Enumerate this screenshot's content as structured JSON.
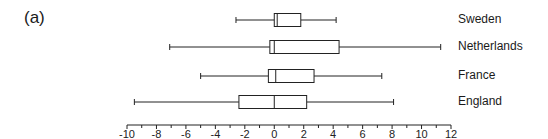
{
  "panel_label": "(a)",
  "chart_data": {
    "type": "boxplot",
    "orientation": "horizontal",
    "title": "",
    "xlabel": "",
    "ylabel": "",
    "xlim": [
      -10,
      12
    ],
    "x_ticks_major": [
      -10,
      -8,
      -6,
      -4,
      -2,
      0,
      2,
      4,
      6,
      8,
      10,
      12
    ],
    "x_ticks_minor": [
      -9,
      -7,
      -5,
      -3,
      -1,
      1,
      3,
      5,
      7,
      9,
      11
    ],
    "grid": false,
    "categories": [
      "Sweden",
      "Netherlands",
      "France",
      "England"
    ],
    "series": [
      {
        "name": "Sweden",
        "whisker_low": -2.6,
        "q1": 0.0,
        "median": 0.2,
        "q3": 1.8,
        "whisker_high": 4.2
      },
      {
        "name": "Netherlands",
        "whisker_low": -7.1,
        "q1": -0.3,
        "median": 0.0,
        "q3": 4.4,
        "whisker_high": 11.3
      },
      {
        "name": "France",
        "whisker_low": -5.0,
        "q1": -0.4,
        "median": 0.1,
        "q3": 2.7,
        "whisker_high": 7.3
      },
      {
        "name": "England",
        "whisker_low": -9.5,
        "q1": -2.4,
        "median": 0.0,
        "q3": 2.2,
        "whisker_high": 8.1
      }
    ]
  },
  "layout": {
    "x0_px": 127,
    "x1_px": 451,
    "axis_y_px": 125,
    "row_centers_px": [
      20,
      47,
      76,
      102
    ],
    "box_half_height_px": 6.5,
    "line_color": "#222222"
  }
}
